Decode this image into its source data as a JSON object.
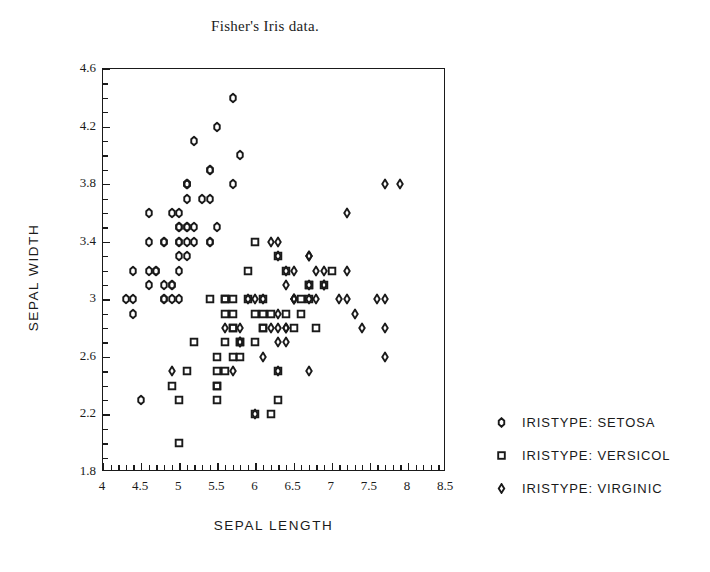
{
  "chart_data": {
    "type": "scatter",
    "title": "Fisher's Iris data.",
    "xlabel": "SEPAL LENGTH",
    "ylabel": "SEPAL WIDTH",
    "xlim": [
      4,
      8.5
    ],
    "ylim": [
      1.8,
      4.6
    ],
    "xticks": [
      4,
      4.5,
      5,
      5.5,
      6,
      6.5,
      7,
      7.5,
      8,
      8.5
    ],
    "xticklabels": [
      "4",
      "4.5",
      "5",
      "5.5",
      "6",
      "6.5",
      "7",
      "7.5",
      "8",
      "8.5"
    ],
    "yticks": [
      1.8,
      2.2,
      2.6,
      3.0,
      3.4,
      3.8,
      4.2,
      4.6
    ],
    "yticklabels": [
      "1.8",
      "2.2",
      "2.6",
      "3",
      "3.4",
      "3.8",
      "4.2",
      "4.6"
    ],
    "xminor_step": 0.1,
    "yminor_step": 0.1,
    "grid": false,
    "legend_position": "right",
    "marker_color": "#1a1a1a",
    "background": "#ffffff",
    "series": [
      {
        "name": "IRISTYPE: SETOSA",
        "marker": "hexagon",
        "points": [
          [
            5.1,
            3.5
          ],
          [
            4.9,
            3.0
          ],
          [
            4.7,
            3.2
          ],
          [
            4.6,
            3.1
          ],
          [
            5.0,
            3.6
          ],
          [
            5.4,
            3.9
          ],
          [
            4.6,
            3.4
          ],
          [
            5.0,
            3.4
          ],
          [
            4.4,
            2.9
          ],
          [
            4.9,
            3.1
          ],
          [
            5.4,
            3.7
          ],
          [
            4.8,
            3.4
          ],
          [
            4.8,
            3.0
          ],
          [
            4.3,
            3.0
          ],
          [
            5.8,
            4.0
          ],
          [
            5.7,
            4.4
          ],
          [
            5.4,
            3.9
          ],
          [
            5.1,
            3.5
          ],
          [
            5.7,
            3.8
          ],
          [
            5.1,
            3.8
          ],
          [
            5.4,
            3.4
          ],
          [
            5.1,
            3.7
          ],
          [
            4.6,
            3.6
          ],
          [
            5.1,
            3.3
          ],
          [
            4.8,
            3.4
          ],
          [
            5.0,
            3.0
          ],
          [
            5.0,
            3.4
          ],
          [
            5.2,
            3.5
          ],
          [
            5.2,
            3.4
          ],
          [
            4.7,
            3.2
          ],
          [
            4.8,
            3.1
          ],
          [
            5.4,
            3.4
          ],
          [
            5.2,
            4.1
          ],
          [
            5.5,
            4.2
          ],
          [
            4.9,
            3.1
          ],
          [
            5.0,
            3.2
          ],
          [
            5.5,
            3.5
          ],
          [
            4.9,
            3.6
          ],
          [
            4.4,
            3.0
          ],
          [
            5.1,
            3.4
          ],
          [
            5.0,
            3.5
          ],
          [
            4.5,
            2.3
          ],
          [
            4.4,
            3.2
          ],
          [
            5.0,
            3.5
          ],
          [
            5.1,
            3.8
          ],
          [
            4.8,
            3.0
          ],
          [
            5.1,
            3.8
          ],
          [
            4.6,
            3.2
          ],
          [
            5.3,
            3.7
          ],
          [
            5.0,
            3.3
          ]
        ]
      },
      {
        "name": "IRISTYPE: VERSICOL",
        "marker": "square",
        "points": [
          [
            7.0,
            3.2
          ],
          [
            6.4,
            3.2
          ],
          [
            6.9,
            3.1
          ],
          [
            5.5,
            2.3
          ],
          [
            6.5,
            2.8
          ],
          [
            5.7,
            2.8
          ],
          [
            6.3,
            3.3
          ],
          [
            4.9,
            2.4
          ],
          [
            6.6,
            2.9
          ],
          [
            5.2,
            2.7
          ],
          [
            5.0,
            2.0
          ],
          [
            5.9,
            3.0
          ],
          [
            6.0,
            2.2
          ],
          [
            6.1,
            2.9
          ],
          [
            5.6,
            2.9
          ],
          [
            6.7,
            3.1
          ],
          [
            5.6,
            3.0
          ],
          [
            5.8,
            2.7
          ],
          [
            6.2,
            2.2
          ],
          [
            5.6,
            2.5
          ],
          [
            5.9,
            3.2
          ],
          [
            6.1,
            2.8
          ],
          [
            6.3,
            2.5
          ],
          [
            6.1,
            2.8
          ],
          [
            6.4,
            2.9
          ],
          [
            6.6,
            3.0
          ],
          [
            6.8,
            2.8
          ],
          [
            6.7,
            3.0
          ],
          [
            6.0,
            2.9
          ],
          [
            5.7,
            2.6
          ],
          [
            5.5,
            2.4
          ],
          [
            5.5,
            2.4
          ],
          [
            5.8,
            2.7
          ],
          [
            6.0,
            2.7
          ],
          [
            5.4,
            3.0
          ],
          [
            6.0,
            3.4
          ],
          [
            6.7,
            3.1
          ],
          [
            6.3,
            2.3
          ],
          [
            5.6,
            3.0
          ],
          [
            5.5,
            2.5
          ],
          [
            5.5,
            2.6
          ],
          [
            6.1,
            3.0
          ],
          [
            5.8,
            2.6
          ],
          [
            5.0,
            2.3
          ],
          [
            5.6,
            2.7
          ],
          [
            5.7,
            3.0
          ],
          [
            5.7,
            2.9
          ],
          [
            6.2,
            2.9
          ],
          [
            5.1,
            2.5
          ],
          [
            5.7,
            2.8
          ]
        ]
      },
      {
        "name": "IRISTYPE: VIRGINIC",
        "marker": "diamond",
        "points": [
          [
            6.3,
            3.3
          ],
          [
            5.8,
            2.7
          ],
          [
            7.1,
            3.0
          ],
          [
            6.3,
            2.9
          ],
          [
            6.5,
            3.0
          ],
          [
            7.6,
            3.0
          ],
          [
            4.9,
            2.5
          ],
          [
            7.3,
            2.9
          ],
          [
            6.7,
            2.5
          ],
          [
            7.2,
            3.6
          ],
          [
            6.5,
            3.2
          ],
          [
            6.4,
            2.7
          ],
          [
            6.8,
            3.0
          ],
          [
            5.7,
            2.5
          ],
          [
            5.8,
            2.8
          ],
          [
            6.4,
            3.2
          ],
          [
            6.5,
            3.0
          ],
          [
            7.7,
            3.8
          ],
          [
            7.7,
            2.6
          ],
          [
            6.0,
            2.2
          ],
          [
            6.9,
            3.2
          ],
          [
            5.6,
            2.8
          ],
          [
            7.7,
            2.8
          ],
          [
            6.3,
            2.7
          ],
          [
            6.7,
            3.3
          ],
          [
            7.2,
            3.2
          ],
          [
            6.2,
            2.8
          ],
          [
            6.1,
            3.0
          ],
          [
            6.4,
            2.8
          ],
          [
            7.2,
            3.0
          ],
          [
            7.4,
            2.8
          ],
          [
            7.9,
            3.8
          ],
          [
            6.4,
            2.8
          ],
          [
            6.3,
            2.8
          ],
          [
            6.1,
            2.6
          ],
          [
            7.7,
            3.0
          ],
          [
            6.3,
            3.4
          ],
          [
            6.4,
            3.1
          ],
          [
            6.0,
            3.0
          ],
          [
            6.9,
            3.1
          ],
          [
            6.7,
            3.1
          ],
          [
            6.9,
            3.1
          ],
          [
            5.8,
            2.7
          ],
          [
            6.8,
            3.2
          ],
          [
            6.7,
            3.3
          ],
          [
            6.7,
            3.0
          ],
          [
            6.3,
            2.5
          ],
          [
            6.5,
            3.0
          ],
          [
            6.2,
            3.4
          ],
          [
            5.9,
            3.0
          ]
        ]
      }
    ]
  },
  "legend": {
    "items": [
      {
        "label": "IRISTYPE: SETOSA",
        "marker": "hexagon"
      },
      {
        "label": "IRISTYPE: VERSICOL",
        "marker": "square"
      },
      {
        "label": "IRISTYPE: VIRGINIC",
        "marker": "diamond"
      }
    ]
  }
}
